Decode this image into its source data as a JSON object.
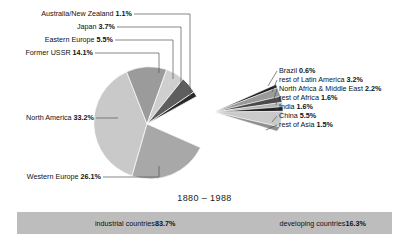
{
  "chart_data": {
    "type": "pie",
    "title": "",
    "subtitle": "",
    "period_label": "1880 – 1988",
    "xlabel": "",
    "ylabel": "",
    "legend_position": "callout-labels",
    "grid": false,
    "categories": [
      "North America",
      "Western Europe",
      "Former USSR",
      "Eastern Europe",
      "Japan",
      "Australia/New Zealand",
      "China",
      "rest of Latin America",
      "North Africa & Middle East",
      "rest of Africa",
      "India",
      "rest of Asia",
      "Brazil"
    ],
    "values": [
      33.2,
      26.1,
      14.1,
      5.5,
      3.7,
      1.1,
      5.5,
      3.2,
      2.2,
      1.6,
      1.6,
      1.5,
      0.6
    ],
    "unit": "%",
    "groups": [
      {
        "name": "industrial countries",
        "value": 83.7,
        "unit": "%"
      },
      {
        "name": "developing countries",
        "value": 16.3,
        "unit": "%"
      }
    ],
    "slices_main": [
      {
        "label": "North America",
        "value": 33.2,
        "display": "North America 33.2%",
        "color": "#c9c9c9"
      },
      {
        "label": "Western Europe",
        "value": 26.1,
        "display": "Western Europe 26.1%",
        "color": "#a8a8a8"
      },
      {
        "label": "Former USSR",
        "value": 14.1,
        "display": "Former USSR 14.1%",
        "color": "#9b9b9b"
      },
      {
        "label": "Eastern Europe",
        "value": 5.5,
        "display": "Eastern Europe 5.5%",
        "color": "#cfcfcf"
      },
      {
        "label": "Japan",
        "value": 3.7,
        "display": "Japan 3.7%",
        "color": "#5e5e5e"
      },
      {
        "label": "Australia/New Zealand",
        "value": 1.1,
        "display": "Australia/New Zealand 1.1%",
        "color": "#2a2a2a"
      }
    ],
    "slices_exploded": [
      {
        "label": "Brazil",
        "value": 0.6,
        "display": "Brazil 0.6%",
        "color": "#1e1e1e"
      },
      {
        "label": "rest of Latin America",
        "value": 3.2,
        "display": "rest of Latin America 3.2%",
        "color": "#9a9a9a"
      },
      {
        "label": "North Africa & Middle East",
        "value": 2.2,
        "display": "North Africa & Middle East 2.2%",
        "color": "#4a4a4a"
      },
      {
        "label": "rest of Africa",
        "value": 1.6,
        "display": "rest of Africa 1.6%",
        "color": "#b5b5b5"
      },
      {
        "label": "India",
        "value": 1.6,
        "display": "India 1.6%",
        "color": "#232323"
      },
      {
        "label": "China",
        "value": 5.5,
        "display": "China 5.5%",
        "color": "#c9c9c9"
      },
      {
        "label": "rest of Asia",
        "value": 1.5,
        "display": "rest of Asia 1.5%",
        "color": "#8f8f8f"
      }
    ]
  },
  "labels": {
    "australia": "Australia/New Zealand 1.1%",
    "japan": "Japan 3.7%",
    "eastern_europe": "Eastern Europe 5.5%",
    "former_ussr": "Former USSR 14.1%",
    "north_america": "North America 33.2%",
    "western_europe": "Western Europe 26.1%",
    "brazil": "Brazil 0.6%",
    "rest_latin_america": "rest of Latin America 3.2%",
    "north_africa_middle_east": "North Africa & Middle East 2.2%",
    "rest_of_africa": "rest of Africa 1.6%",
    "india": "India 1.6%",
    "china": "China 5.5%",
    "rest_of_asia": "rest of Asia 1.5%"
  },
  "period": "1880 – 1988",
  "footer": {
    "industrial": "industrial countries 83.7%",
    "developing": "developing countries 16.3%",
    "bar_color": "#bdbdbd"
  }
}
